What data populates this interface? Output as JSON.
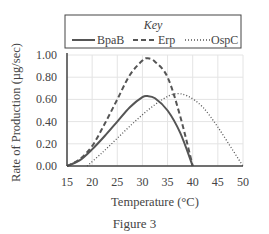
{
  "chart_data": {
    "type": "line",
    "title": "",
    "xlabel": "Temperature (°C)",
    "ylabel": "Rate of Production (µg/sec)",
    "xlim": [
      15,
      50
    ],
    "ylim": [
      0,
      1.0
    ],
    "x_ticks": [
      "15",
      "20",
      "25",
      "30",
      "35",
      "40",
      "45",
      "50"
    ],
    "y_ticks": [
      "0.00",
      "0.20",
      "0.40",
      "0.60",
      "0.80",
      "1.00"
    ],
    "grid": true,
    "legend": {
      "title": "Key",
      "position": "top",
      "entries": [
        "BpaB",
        "Erp",
        "OspC"
      ]
    },
    "series": [
      {
        "name": "BpaB",
        "style": "solid",
        "x": [
          15,
          17.5,
          20,
          22.5,
          25,
          27.5,
          30,
          31,
          32.5,
          35,
          37.5,
          40
        ],
        "y": [
          0,
          0.05,
          0.15,
          0.27,
          0.4,
          0.53,
          0.62,
          0.63,
          0.61,
          0.5,
          0.3,
          0
        ]
      },
      {
        "name": "Erp",
        "style": "dashed",
        "x": [
          15,
          17.5,
          20,
          22.5,
          25,
          27.5,
          30,
          31,
          32.5,
          35,
          37.5,
          40
        ],
        "y": [
          0,
          0.06,
          0.18,
          0.38,
          0.6,
          0.82,
          0.95,
          0.97,
          0.94,
          0.8,
          0.45,
          0
        ]
      },
      {
        "name": "OspC",
        "style": "dotted",
        "x": [
          19,
          22,
          25,
          28,
          31,
          34,
          36.5,
          39,
          42,
          45,
          48,
          50
        ],
        "y": [
          0,
          0.12,
          0.25,
          0.38,
          0.5,
          0.6,
          0.65,
          0.63,
          0.53,
          0.35,
          0.14,
          0
        ]
      }
    ]
  },
  "caption": "Figure 3",
  "colors": {
    "line": "#555555",
    "grid": "#e4e4e4",
    "axis": "#444444"
  }
}
